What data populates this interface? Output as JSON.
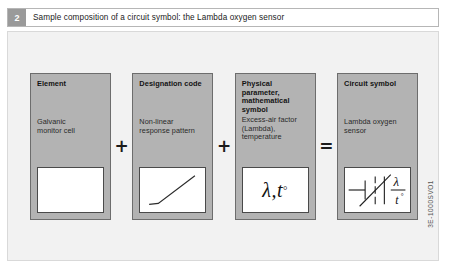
{
  "caption": {
    "number": "2",
    "text": "Sample composition of a circuit symbol: the Lambda oxygen sensor"
  },
  "diagram": {
    "cards": [
      {
        "title": "Element",
        "subtitle": "Galvanic\nmonitor cell",
        "figure": "blank-box"
      },
      {
        "title": "Designation code",
        "subtitle": "Non-linear\nresponse pattern",
        "figure": "nonlinear-curve-graph"
      },
      {
        "title": "Physical\nparameter,\nmathematical\nsymbol",
        "subtitle": "Excess-air factor\n(Lambda),\ntemperature",
        "figure": "lambda-t-degree-symbol",
        "symbol_text": "λ,t",
        "symbol_degree": "°"
      },
      {
        "title": "Circuit symbol",
        "subtitle": "Lambda oxygen\nsensor",
        "figure": "lambda-sensor-circuit-symbol",
        "symbol_lambda": "λ",
        "symbol_t": "t",
        "symbol_degree": "°"
      }
    ],
    "operators": [
      "+",
      "+",
      "="
    ]
  },
  "source_code": "3E-1000SVO1",
  "colors": {
    "card_fill": "#b3b3b3",
    "card_border": "#6d6d6d",
    "panel_bg": "#f2f2f2",
    "badge_bg": "#9a9a9a",
    "figure_bg": "#ffffff"
  }
}
